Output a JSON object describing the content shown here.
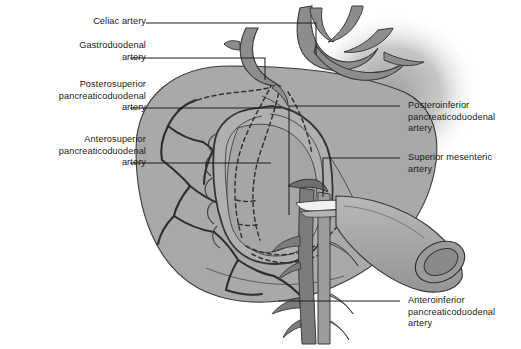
{
  "figure": {
    "kind": "anatomical-illustration",
    "style": "grayscale line drawing",
    "background_color": "#ffffff",
    "organ_fill": "#a9a9a9",
    "organ_fill_light": "#b6b6b6",
    "vessel_fill": "#8f8f8f",
    "vessel_dark": "#7b7b7b",
    "outline_color": "#2b2b2b",
    "leader_color": "#1f1f1f",
    "text_color": "#1a1a1a"
  },
  "labels_left": [
    {
      "id": "celiac-artery",
      "text": "Celiac artery",
      "lines": [
        "Celiac artery"
      ],
      "align": "right",
      "x": 78,
      "y": 16,
      "leader": {
        "from_x": 146,
        "from_y": 23,
        "to_x": 316,
        "to_y": 23,
        "drop_to_y": 55
      }
    },
    {
      "id": "gastroduodenal-artery",
      "text": "Gastroduodenal artery",
      "lines": [
        "Gastroduodenal",
        "artery"
      ],
      "align": "right",
      "x": 36,
      "y": 40,
      "leader": {
        "from_x": 130,
        "from_y": 58,
        "to_x": 265,
        "to_y": 58,
        "drop_to_y": 80
      }
    },
    {
      "id": "posterosuperior-pancreaticoduodenal-artery",
      "text": "Posterosuperior pancreaticoduodenal artery",
      "lines": [
        "Posterosuperior",
        "pancreaticoduodenal",
        "artery"
      ],
      "align": "right",
      "x": 16,
      "y": 79,
      "leader": {
        "from_x": 130,
        "from_y": 108,
        "to_x": 281,
        "to_y": 108,
        "drop_to_y": null
      }
    },
    {
      "id": "anterosuperior-pancreaticoduodenal-artery",
      "text": "Anterosuperior pancreaticoduodenal artery",
      "lines": [
        "Anterosuperior",
        "pancreaticoduodenal",
        "artery"
      ],
      "align": "right",
      "x": 16,
      "y": 134,
      "leader": {
        "from_x": 130,
        "from_y": 163,
        "to_x": 271,
        "to_y": 163,
        "drop_to_y": null
      }
    }
  ],
  "labels_right": [
    {
      "id": "posteroinferior-pancreaticoduodenal-artery",
      "text": "Posteroinferior pancreaticoduodenal artery",
      "lines": [
        "Posteroinferior",
        "pancreaticoduodenal",
        "artery"
      ],
      "align": "left",
      "x": 408,
      "y": 100,
      "leader": {
        "from_x": 400,
        "from_y": 106,
        "to_x": 289,
        "to_y": 106,
        "drop_to_y": 215
      }
    },
    {
      "id": "superior-mesenteric-artery",
      "text": "Superior mesenteric artery",
      "lines": [
        "Superior mesenteric",
        "artery"
      ],
      "align": "left",
      "x": 408,
      "y": 152,
      "leader": {
        "from_x": 400,
        "from_y": 158,
        "to_x": 323,
        "to_y": 158,
        "drop_to_y": 197
      }
    },
    {
      "id": "anteroinferior-pancreaticoduodenal-artery",
      "text": "Anteroinferior pancreaticoduodenal artery",
      "lines": [
        "Anteroinferior",
        "pancreaticoduodenal",
        "artery"
      ],
      "align": "left",
      "x": 408,
      "y": 295,
      "leader": {
        "from_x": 400,
        "from_y": 301,
        "to_x": 278,
        "to_y": 301,
        "drop_to_y": null
      }
    }
  ],
  "structures": [
    {
      "id": "pancreas-head-mass",
      "name": "pancreas and surrounding mass",
      "note": "large ovoid gray body occupying the center-left"
    },
    {
      "id": "duodenum-c-loop",
      "name": "duodenal C-loop",
      "note": "C-shaped loop enclosing the pancreatic head"
    },
    {
      "id": "celiac-trunk",
      "name": "celiac trunk with branches",
      "note": "upper right tripod-shaped vessel"
    },
    {
      "id": "gastroduodenal-trunk",
      "name": "gastroduodenal artery",
      "note": "curved vessel descending to duodenum"
    },
    {
      "id": "sma-smv-bundle",
      "name": "superior mesenteric vessels",
      "note": "vertical vessel pair descending below pancreas"
    },
    {
      "id": "pd-arcades",
      "name": "pancreaticoduodenal arcades",
      "note": "dashed anterior/posterior arterial arcades"
    },
    {
      "id": "cut-jejunum",
      "name": "cut end of bowel",
      "note": "tubular cut stump lower right"
    },
    {
      "id": "vignette-shadow",
      "name": "soft shadow",
      "note": "blurred gray halo at upper right"
    }
  ]
}
